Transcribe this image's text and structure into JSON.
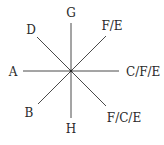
{
  "diagram": {
    "center": {
      "x": 71,
      "y": 71
    },
    "line_color": "#4a4a4a",
    "text_color": "#2a2a2a",
    "rays": [
      {
        "id": "up",
        "direction": "N",
        "x2": 71,
        "y2": 23,
        "label": "G",
        "lx": 71,
        "ly": 17,
        "anchor": "middle"
      },
      {
        "id": "down",
        "direction": "S",
        "x2": 71,
        "y2": 118,
        "label": "H",
        "lx": 71,
        "ly": 133,
        "anchor": "middle"
      },
      {
        "id": "left",
        "direction": "W",
        "x2": 23,
        "y2": 71,
        "label": "A",
        "lx": 13,
        "ly": 76,
        "anchor": "middle"
      },
      {
        "id": "right",
        "direction": "E",
        "x2": 119,
        "y2": 71,
        "label": "C/F/E",
        "lx": 126,
        "ly": 76,
        "anchor": "start"
      },
      {
        "id": "up-left",
        "direction": "NW",
        "x2": 37,
        "y2": 37,
        "label": "D",
        "lx": 31,
        "ly": 34,
        "anchor": "middle"
      },
      {
        "id": "up-right",
        "direction": "NE",
        "x2": 106,
        "y2": 36,
        "label": "F/E",
        "lx": 112,
        "ly": 30,
        "anchor": "middle"
      },
      {
        "id": "down-left",
        "direction": "SW",
        "x2": 38,
        "y2": 104,
        "label": "B",
        "lx": 29,
        "ly": 117,
        "anchor": "middle"
      },
      {
        "id": "down-right",
        "direction": "SE",
        "x2": 106,
        "y2": 106,
        "label": "F/C/E",
        "lx": 124,
        "ly": 122,
        "anchor": "middle"
      }
    ]
  }
}
